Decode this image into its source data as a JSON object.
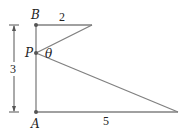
{
  "diagram": {
    "points": {
      "A": {
        "label": "A",
        "x": 36,
        "y": 112
      },
      "B": {
        "label": "B",
        "x": 36,
        "y": 25
      },
      "P": {
        "label": "P",
        "x": 36,
        "y": 53
      },
      "top_end": {
        "x": 92,
        "y": 25
      },
      "bottom_end": {
        "x": 178,
        "y": 112
      }
    },
    "labels": {
      "B": "B",
      "P": "P",
      "A": "A",
      "theta": "θ",
      "top_length": "2",
      "bottom_length": "5",
      "height": "3"
    },
    "colors": {
      "line": "#808080",
      "point": "#555555",
      "text": "#222222"
    }
  }
}
